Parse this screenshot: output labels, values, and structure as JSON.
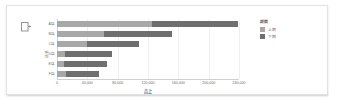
{
  "card": {
    "corner_icon": "chart-element-callout-icon"
  },
  "chart_data": {
    "type": "bar",
    "orientation": "horizontal",
    "stacked": true,
    "title": "",
    "xlabel": "売上",
    "ylabel": "店名",
    "categories": [
      "A店",
      "B店",
      "C店",
      "D店",
      "E店",
      "F店"
    ],
    "series": [
      {
        "name": "上期",
        "color": "#a8a8a8",
        "values": [
          125000,
          62000,
          40000,
          10000,
          9000,
          12000
        ]
      },
      {
        "name": "下期",
        "color": "#6f6f6f",
        "values": [
          114000,
          89000,
          68000,
          62000,
          57000,
          43000
        ]
      }
    ],
    "totals": [
      239000,
      151000,
      108000,
      72000,
      66000,
      55000
    ],
    "xlim": [
      0,
      240000
    ],
    "xticks": [
      0,
      40000,
      80000,
      120000,
      160000,
      200000,
      240000
    ],
    "xtick_labels": [
      "0",
      "40,000",
      "80,000",
      "120,000",
      "160,000",
      "200,000",
      "240,000"
    ],
    "grid": true,
    "legend": {
      "title": "期間",
      "position": "right",
      "entries": [
        "上期",
        "下期"
      ]
    }
  }
}
